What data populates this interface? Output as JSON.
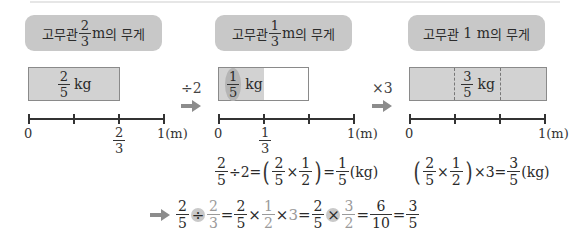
{
  "top_rule": true,
  "panels": [
    {
      "title_prefix": "고무관",
      "title_frac": {
        "num": "2",
        "den": "3"
      },
      "title_suffix_unit": "m",
      "title_suffix": "의 무게",
      "bar_label_frac": {
        "num": "2",
        "den": "5"
      },
      "bar_label_unit": "kg",
      "axis_labels": {
        "start": "0",
        "tick_frac": {
          "num": "2",
          "den": "3"
        },
        "end": "1",
        "end_unit": "(m)"
      }
    },
    {
      "title_prefix": "고무관",
      "title_frac": {
        "num": "1",
        "den": "3"
      },
      "title_suffix_unit": "m",
      "title_suffix": "의 무게",
      "bar_label_frac": {
        "num": "1",
        "den": "5"
      },
      "bar_label_unit": "kg",
      "axis_labels": {
        "start": "0",
        "tick_frac": {
          "num": "1",
          "den": "3"
        },
        "end": "1",
        "end_unit": "(m)"
      }
    },
    {
      "title_prefix": "고무관",
      "title_value": "1",
      "title_suffix_unit": "m",
      "title_suffix": "의 무게",
      "bar_label_frac": {
        "num": "3",
        "den": "5"
      },
      "bar_label_unit": "kg",
      "axis_labels": {
        "start": "0",
        "end": "1",
        "end_unit": "(m)"
      }
    }
  ],
  "operators": [
    {
      "label": "÷2",
      "icon": "right-arrow-icon"
    },
    {
      "label": "×3",
      "icon": "right-arrow-icon"
    }
  ],
  "equations": {
    "left": {
      "a": {
        "num": "2",
        "den": "5"
      },
      "op1": "÷",
      "b": "2",
      "eq1": "=",
      "p1": {
        "num": "2",
        "den": "5"
      },
      "times": "×",
      "p2": {
        "num": "1",
        "den": "2"
      },
      "eq2": "=",
      "r": {
        "num": "1",
        "den": "5"
      },
      "unit": "(kg)"
    },
    "right": {
      "p1": {
        "num": "2",
        "den": "5"
      },
      "times": "×",
      "p2": {
        "num": "1",
        "den": "2"
      },
      "times2": "×",
      "b": "3",
      "eq": "=",
      "r": {
        "num": "3",
        "den": "5"
      },
      "unit": "(kg)"
    },
    "final": {
      "icon": "right-arrow-icon",
      "f1": {
        "num": "2",
        "den": "5"
      },
      "div": "÷",
      "f2": {
        "num": "2",
        "den": "3"
      },
      "eq1": "=",
      "f3": {
        "num": "2",
        "den": "5"
      },
      "x1": "×",
      "f4": {
        "num": "1",
        "den": "2"
      },
      "x2": "×",
      "f5": "3",
      "eq2": "=",
      "f6": {
        "num": "2",
        "den": "5"
      },
      "x3": "×",
      "f7": {
        "num": "3",
        "den": "2"
      },
      "eq3": "=",
      "f8": {
        "num": "6",
        "den": "10"
      },
      "eq4": "=",
      "f9": {
        "num": "3",
        "den": "5"
      }
    }
  },
  "colors": {
    "pill": "#c8c8c8",
    "bar_fill": "#d2d2d2",
    "arrow": "#8c8c8c",
    "highlight": "#c9c9c9",
    "gray_text": "#9a9a9a"
  }
}
